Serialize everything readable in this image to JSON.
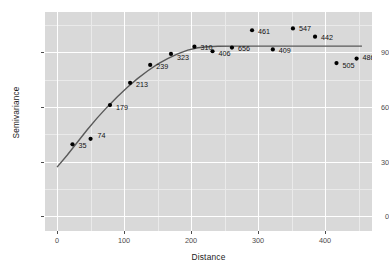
{
  "chart_data": {
    "type": "scatter",
    "title": "",
    "xlabel": "Distance",
    "ylabel": "Semivariance",
    "xlim": [
      -18,
      470
    ],
    "ylim": [
      -8,
      112
    ],
    "xticks": [
      0,
      100,
      200,
      300,
      400
    ],
    "xtick_labels": [
      "0",
      "100",
      "200",
      "300",
      "400"
    ],
    "yticks": [
      0,
      30,
      60,
      90
    ],
    "ytick_labels": [
      "0",
      "30",
      "60",
      "90"
    ],
    "grid": true,
    "legend": "none",
    "panel_background": "#d9d9d9",
    "grid_major_color": "#ffffff",
    "grid_minor_color": "#eaeaea",
    "point_color": "#000000",
    "line_color": "#595959",
    "points": [
      {
        "label": "35",
        "x": 23,
        "y": 39.5,
        "lx": 6,
        "ly": 1
      },
      {
        "label": "74",
        "x": 50,
        "y": 42.5,
        "lx": 7,
        "ly": -3
      },
      {
        "label": "179",
        "x": 79,
        "y": 61.0,
        "lx": 6,
        "ly": 2
      },
      {
        "label": "213",
        "x": 109,
        "y": 73.2,
        "lx": 6,
        "ly": 2
      },
      {
        "label": "239",
        "x": 139,
        "y": 83.0,
        "lx": 6,
        "ly": 2
      },
      {
        "label": "323",
        "x": 170,
        "y": 89.0,
        "lx": 6,
        "ly": 3
      },
      {
        "label": "310",
        "x": 205,
        "y": 93.0,
        "lx": 6,
        "ly": 1
      },
      {
        "label": "406",
        "x": 232,
        "y": 90.5,
        "lx": 6,
        "ly": 2
      },
      {
        "label": "656",
        "x": 261,
        "y": 92.5,
        "lx": 6,
        "ly": 1
      },
      {
        "label": "461",
        "x": 291,
        "y": 102.0,
        "lx": 6,
        "ly": 1
      },
      {
        "label": "409",
        "x": 322,
        "y": 91.5,
        "lx": 6,
        "ly": 1
      },
      {
        "label": "547",
        "x": 352,
        "y": 103.0,
        "lx": 6,
        "ly": 0
      },
      {
        "label": "442",
        "x": 385,
        "y": 98.5,
        "lx": 6,
        "ly": 1
      },
      {
        "label": "505",
        "x": 417,
        "y": 84.0,
        "lx": 6,
        "ly": 2
      },
      {
        "label": "486",
        "x": 447,
        "y": 86.5,
        "lx": 6,
        "ly": -1
      }
    ],
    "fitted_curve": [
      {
        "x": 0,
        "y": 27.0
      },
      {
        "x": 15,
        "y": 33.5
      },
      {
        "x": 30,
        "y": 40.5
      },
      {
        "x": 45,
        "y": 47.5
      },
      {
        "x": 60,
        "y": 54.0
      },
      {
        "x": 75,
        "y": 60.0
      },
      {
        "x": 90,
        "y": 65.6
      },
      {
        "x": 105,
        "y": 70.8
      },
      {
        "x": 120,
        "y": 75.5
      },
      {
        "x": 135,
        "y": 79.7
      },
      {
        "x": 150,
        "y": 83.4
      },
      {
        "x": 165,
        "y": 86.5
      },
      {
        "x": 180,
        "y": 89.1
      },
      {
        "x": 195,
        "y": 91.1
      },
      {
        "x": 210,
        "y": 92.4
      },
      {
        "x": 225,
        "y": 93.0
      },
      {
        "x": 240,
        "y": 93.2
      },
      {
        "x": 270,
        "y": 93.3
      },
      {
        "x": 300,
        "y": 93.3
      },
      {
        "x": 340,
        "y": 93.3
      },
      {
        "x": 380,
        "y": 93.3
      },
      {
        "x": 420,
        "y": 93.3
      },
      {
        "x": 455,
        "y": 93.3
      }
    ]
  }
}
